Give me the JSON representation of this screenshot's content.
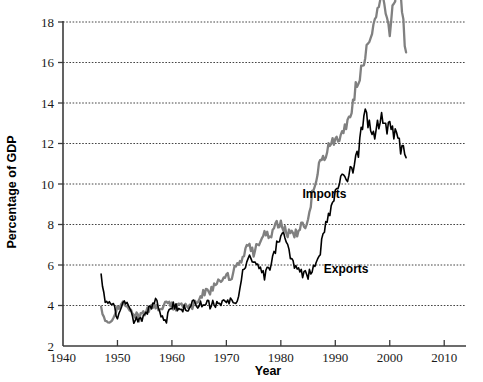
{
  "chart_data": {
    "type": "line",
    "title": "",
    "xlabel": "Year",
    "ylabel": "Percentage of GDP",
    "xlim": [
      1940,
      2014
    ],
    "ylim": [
      2,
      18
    ],
    "xticks": [
      1940,
      1950,
      1960,
      1970,
      1980,
      1990,
      2000,
      2010
    ],
    "yticks": [
      2,
      4,
      6,
      8,
      10,
      12,
      14,
      16,
      18
    ],
    "grid": true,
    "gridlines_y": [
      4,
      6,
      8,
      10,
      12,
      14,
      16,
      18
    ],
    "legend_position": "inline-annotations",
    "annotations": [
      {
        "text": "Imports",
        "x": 1988,
        "y": 9.3
      },
      {
        "text": "Exports",
        "x": 1992,
        "y": 5.6
      }
    ],
    "colors": {
      "imports": "#808080",
      "exports": "#000000",
      "axis": "#3b3b3b",
      "grid": "#444444"
    },
    "series": [
      {
        "name": "Imports",
        "color": "#808080",
        "x": [
          1947,
          1948,
          1949,
          1950,
          1951,
          1952,
          1953,
          1954,
          1955,
          1956,
          1957,
          1958,
          1959,
          1960,
          1961,
          1962,
          1963,
          1964,
          1965,
          1966,
          1967,
          1968,
          1969,
          1970,
          1971,
          1972,
          1973,
          1974,
          1975,
          1976,
          1977,
          1978,
          1979,
          1980,
          1981,
          1982,
          1983,
          1984,
          1985,
          1986,
          1987,
          1988,
          1989,
          1990,
          1991,
          1992,
          1993,
          1994,
          1995,
          1996,
          1997,
          1998,
          1999,
          2000,
          2001,
          2002,
          2003
        ],
        "values": [
          3.9,
          3.1,
          3.2,
          3.9,
          4.2,
          3.9,
          3.6,
          3.4,
          3.7,
          3.9,
          4.0,
          3.8,
          4.2,
          4.0,
          3.9,
          4.0,
          4.0,
          4.0,
          4.3,
          4.7,
          4.7,
          5.1,
          5.2,
          5.4,
          5.5,
          6.0,
          6.3,
          7.0,
          6.6,
          7.2,
          7.5,
          7.4,
          8.0,
          8.1,
          7.6,
          7.5,
          7.6,
          8.0,
          8.1,
          9.6,
          10.3,
          10.5,
          10.7,
          10.8,
          10.5,
          10.8,
          11.2,
          12.0,
          12.4,
          12.8,
          13.5,
          13.7,
          14.5,
          16.5,
          15.6,
          16.3,
          16.5
        ],
        "peak": {
          "year": 2000,
          "value": 17.3
        },
        "end_value": 16.5
      },
      {
        "name": "Exports",
        "color": "#000000",
        "x": [
          1947,
          1948,
          1949,
          1950,
          1951,
          1952,
          1953,
          1954,
          1955,
          1956,
          1957,
          1958,
          1959,
          1960,
          1961,
          1962,
          1963,
          1964,
          1965,
          1966,
          1967,
          1968,
          1969,
          1970,
          1971,
          1972,
          1973,
          1974,
          1975,
          1976,
          1977,
          1978,
          1979,
          1980,
          1981,
          1982,
          1983,
          1984,
          1985,
          1986,
          1987,
          1988,
          1989,
          1990,
          1991,
          1992,
          1993,
          1994,
          1995,
          1996,
          1997,
          1998,
          1999,
          2000,
          2001,
          2002,
          2003
        ],
        "values": [
          5.5,
          4.0,
          4.1,
          3.5,
          4.2,
          4.0,
          3.2,
          3.3,
          3.4,
          3.9,
          4.2,
          3.6,
          3.3,
          4.0,
          3.9,
          3.8,
          3.9,
          4.2,
          4.0,
          4.1,
          4.0,
          4.1,
          4.1,
          4.3,
          4.2,
          4.3,
          5.8,
          6.4,
          6.1,
          5.8,
          5.5,
          5.9,
          6.8,
          7.6,
          7.1,
          6.2,
          5.7,
          5.6,
          5.5,
          5.6,
          6.0,
          7.2,
          7.8,
          8.4,
          8.8,
          8.7,
          8.7,
          9.1,
          9.8,
          9.6,
          10.2,
          9.4,
          9.2,
          10.0,
          9.2,
          8.6,
          8.0
        ],
        "peak": {
          "year": 1997,
          "value": 12.6
        },
        "end_value": 11.3
      }
    ]
  },
  "axis": {
    "y_title": "Percentage of GDP",
    "x_title": "Year",
    "y_tick_labels": [
      "2",
      "4",
      "6",
      "8",
      "10",
      "12",
      "14",
      "16",
      "18"
    ],
    "x_tick_labels": [
      "1940",
      "1950",
      "1960",
      "1970",
      "1980",
      "1990",
      "2000",
      "2010"
    ]
  },
  "labels": {
    "imports": "Imports",
    "exports": "Exports"
  }
}
